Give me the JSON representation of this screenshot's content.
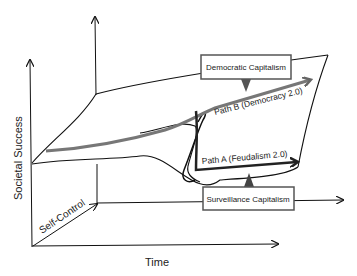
{
  "diagram": {
    "axes": {
      "y_label": "Societal Success",
      "x_label": "Time",
      "z_label": "Self-Control"
    },
    "callouts": {
      "top": "Democratic Capitalism",
      "bottom": "Surveillance Capitalism"
    },
    "paths": {
      "path_b": "Path B (Democracy 2.0)",
      "path_a": "Path A (Feudalism 2.0)"
    },
    "colors": {
      "line": "#111111",
      "path_b": "#777777",
      "path_a": "#333333",
      "callout_border": "#555555"
    }
  }
}
